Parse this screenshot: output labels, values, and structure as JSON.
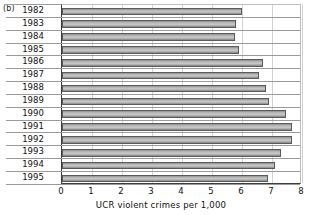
{
  "panel": {
    "label": "(b)"
  },
  "chart_data": {
    "type": "bar",
    "orientation": "horizontal",
    "title": "",
    "xlabel": "UCR violent crimes per 1,000",
    "ylabel": "",
    "xlim": [
      0,
      8
    ],
    "xticks": [
      0,
      1,
      2,
      3,
      4,
      5,
      6,
      7,
      8
    ],
    "xtick_labels": [
      "0",
      "1",
      "2",
      "3",
      "4",
      "5",
      "6",
      "7",
      "8"
    ],
    "grid": true,
    "legend": null,
    "categories": [
      "1982",
      "1983",
      "1984",
      "1985",
      "1986",
      "1987",
      "1988",
      "1989",
      "1990",
      "1991",
      "1992",
      "1993",
      "1994",
      "1995"
    ],
    "values": [
      6.0,
      5.8,
      5.75,
      5.9,
      6.7,
      6.55,
      6.8,
      6.9,
      7.45,
      7.65,
      7.65,
      7.3,
      7.1,
      6.85
    ],
    "bar_color": "#b4b4b4",
    "bar_edge_color": "#5a5a5a"
  }
}
